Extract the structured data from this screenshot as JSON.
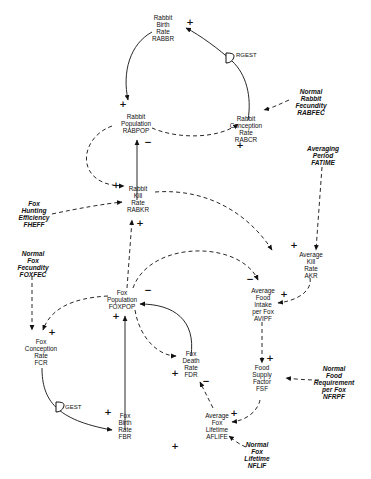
{
  "nodes": {
    "rabbr": [
      "Rabbit",
      "Birth",
      "Rate",
      "RABBR"
    ],
    "rabcr": [
      "Rabbit",
      "Conception",
      "Rate",
      "RABCR"
    ],
    "rabfec": [
      "Normal",
      "Rabbit",
      "Fecundity",
      "RABFEC"
    ],
    "rabpop": [
      "Rabbit",
      "Population",
      "RABPOP"
    ],
    "rabkr": [
      "Rabbit",
      "Kill",
      "Rate",
      "RABKR"
    ],
    "fheff": [
      "Fox",
      "Hunting",
      "Efficiency",
      "FHEFF"
    ],
    "fatime": [
      "Averaging",
      "Period",
      "FATIME"
    ],
    "akr": [
      "Average",
      "Kill",
      "Rate",
      "AKR"
    ],
    "foxfec": [
      "Normal",
      "Fox",
      "Fecundity",
      "FOXFEC"
    ],
    "foxpop": [
      "Fox",
      "Population",
      "FOXPOP"
    ],
    "avipf": [
      "Average",
      "Food",
      "Intake",
      "per Fox",
      "AVIPF"
    ],
    "fcr": [
      "Fox",
      "Conception",
      "Rate",
      "FCR"
    ],
    "fdr": [
      "Fox",
      "Death",
      "Rate",
      "FDR"
    ],
    "fsf": [
      "Food",
      "Supply",
      "Factor",
      "FSF"
    ],
    "nfrpf": [
      "Normal",
      "Food",
      "Requirement",
      "per Fox",
      "NFRPF"
    ],
    "fbr": [
      "Fox",
      "Birth",
      "Rate",
      "FBR"
    ],
    "aflife": [
      "Average",
      "Fox",
      "Lifetime",
      "AFLIFE"
    ],
    "nflif": [
      "Normal",
      "Fox",
      "Lifetime",
      "NFLIF"
    ]
  },
  "delays": {
    "rabbit": "RGEST",
    "fox": "GEST"
  },
  "signs": {
    "plus": "+",
    "minus": "−"
  }
}
